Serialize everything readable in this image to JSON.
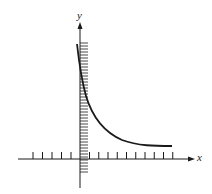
{
  "figure": {
    "x_axis_label": "x",
    "y_axis_label": "y",
    "colors": {
      "ink": "#1a1a1a",
      "background": "#ffffff"
    },
    "x_ticks_left_count": 5,
    "x_ticks_right_count": 10,
    "hatch_line_count": 44
  },
  "chart_data": {
    "type": "line",
    "title": "",
    "xlabel": "x",
    "ylabel": "y",
    "series": [
      {
        "name": "curve",
        "shape": "exponential decay to horizontal asymptote",
        "points_px": [
          [
            77,
            44
          ],
          [
            80,
            70
          ],
          [
            85,
            95
          ],
          [
            95,
            118
          ],
          [
            110,
            133
          ],
          [
            130,
            142
          ],
          [
            150,
            145
          ],
          [
            172,
            146
          ]
        ]
      }
    ],
    "grid": false,
    "legend": null
  }
}
